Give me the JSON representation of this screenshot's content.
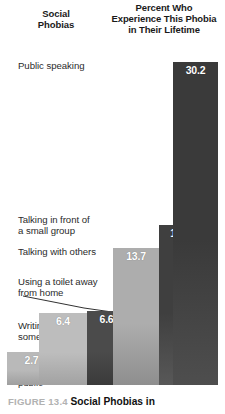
{
  "headers": {
    "left": [
      "Social",
      "Phobias"
    ],
    "right": [
      "Percent Who",
      "Experience This Phobia",
      "in Their Lifetime"
    ]
  },
  "caption": {
    "figure_number": "FIGURE 13.4",
    "title": "Social Phobias in"
  },
  "chart_data": {
    "type": "bar",
    "title": "Percent Who Experience This Phobia in Their Lifetime",
    "xlabel": "Social Phobias",
    "ylabel": "Percent",
    "ylim": [
      0,
      32
    ],
    "grid": false,
    "legend": "none",
    "orientation": "vertical",
    "note": "Overlapping staircase bars; darker fill indicates higher prevalence. Leader line connects the 'Using a toilet away from home' label to its 6.6 bar.",
    "categories": [
      "Eating or drinking in public",
      "Writing while someone watches",
      "Using a toilet away from home",
      "Talking with others",
      "Talking in front of a small group",
      "Public speaking"
    ],
    "values": [
      2.7,
      6.4,
      6.6,
      13.7,
      15.2,
      30.2
    ],
    "bars": [
      {
        "label": "Eating or\ndrinking in\npublic",
        "value": 2.7,
        "value_text": "2.7",
        "color": "#b9b9b9",
        "color_bottom": "#9f9f9f",
        "x": 7,
        "width": 49,
        "top": 352,
        "height": 33,
        "label_x": 18,
        "label_y": 354,
        "z": 1
      },
      {
        "label": "Writing while\nsomeone watches",
        "value": 6.4,
        "value_text": "6.4",
        "color": "#bdbdbd",
        "color_bottom": "#a2a2a2",
        "x": 39,
        "width": 48,
        "top": 313,
        "height": 72,
        "label_x": 18,
        "label_y": 320,
        "z": 2
      },
      {
        "label": "Using a toilet away\nfrom home",
        "value": 6.6,
        "value_text": "6.6",
        "color": "#4b4b4b",
        "color_bottom": "#3a3a3a",
        "x": 87,
        "width": 39,
        "top": 311,
        "height": 74,
        "label_x": 18,
        "label_y": 276,
        "z": 3
      },
      {
        "label": "Talking with others",
        "value": 13.7,
        "value_text": "13.7",
        "color": "#adadad",
        "color_bottom": "#8e8e8e",
        "x": 113,
        "width": 46,
        "top": 248,
        "height": 137,
        "label_x": 18,
        "label_y": 246,
        "z": 4
      },
      {
        "label": "Talking in front of\na small group",
        "value": 15.2,
        "value_text": "15.2",
        "color": "#3f3f3f",
        "color_bottom": "#585858",
        "x": 159,
        "width": 42,
        "top": 225,
        "height": 160,
        "label_x": 18,
        "label_y": 214,
        "z": 5
      },
      {
        "label": "Public speaking",
        "value": 30.2,
        "value_text": "30.2",
        "color": "#3a3a3a",
        "color_bottom": "#4e4e4e",
        "x": 173,
        "width": 45,
        "top": 62,
        "height": 323,
        "label_x": 18,
        "label_y": 60,
        "z": 6
      }
    ],
    "leader_line": {
      "from_label": "Using a toilet away from home",
      "points": "23,296 84,308 126,314"
    }
  }
}
